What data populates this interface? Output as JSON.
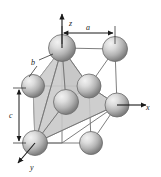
{
  "figure": {
    "name": "crystal-unit-cell-diagram",
    "background_color": "#ffffff",
    "line_color": "#6b6b6b",
    "axis_color": "#1a1a1a",
    "polygon_fill": "#c9c9c9",
    "polygon_stroke": "#9a9a9a",
    "sphere_light": "#e8e8e8",
    "sphere_mid": "#b8b8b8",
    "sphere_dark": "#7a7a7a",
    "sphere_outline": "#5a5a5a"
  },
  "axes": [
    {
      "id": "z",
      "label": "z",
      "direction": "up",
      "label_x": 69,
      "label_y": 26
    },
    {
      "id": "x",
      "label": "x",
      "direction": "right",
      "label_x": 146,
      "label_y": 110
    },
    {
      "id": "y",
      "label": "y",
      "direction": "down-left",
      "label_x": 30,
      "label_y": 170
    }
  ],
  "dimensions": [
    {
      "id": "a",
      "label": "a",
      "orientation": "horizontal",
      "label_x": 88,
      "label_y": 28,
      "note": "top edge length between top-front-left and top-front-right atoms"
    },
    {
      "id": "b",
      "label": "b",
      "orientation": "diagonal",
      "label_x": 33,
      "label_y": 62,
      "note": "diagonal bond from top atom to left-rear atom"
    },
    {
      "id": "c",
      "label": "c",
      "orientation": "vertical",
      "label_x": 16,
      "label_y": 115,
      "note": "vertical cell height on left side"
    }
  ],
  "atoms": [
    {
      "id": "atom-top-left",
      "cx": 62,
      "cy": 48,
      "r": 13.5
    },
    {
      "id": "atom-top-right",
      "cx": 115,
      "cy": 49,
      "r": 12.5
    },
    {
      "id": "atom-mid-left",
      "cx": 33,
      "cy": 86,
      "r": 11.5
    },
    {
      "id": "atom-inner-upper",
      "cx": 89,
      "cy": 86,
      "r": 12.0
    },
    {
      "id": "atom-inner-lower",
      "cx": 66,
      "cy": 102,
      "r": 12.5
    },
    {
      "id": "atom-mid-right",
      "cx": 117,
      "cy": 105,
      "r": 12.0
    },
    {
      "id": "atom-bottom-left",
      "cx": 35,
      "cy": 143,
      "r": 12.5
    },
    {
      "id": "atom-bottom-mid",
      "cx": 91,
      "cy": 143,
      "r": 11.5
    }
  ],
  "shaded_polygon": {
    "id": "tetrahedron-face",
    "description": "grey shaded tetrahedron connecting top atom, inner atoms, right atom and bottom-left atom"
  },
  "title": "",
  "caption": ""
}
